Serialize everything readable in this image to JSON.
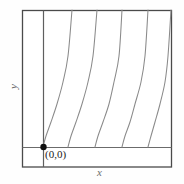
{
  "figure": {
    "background_color": "#fefefe",
    "frame_color": "#4a4a4a",
    "axis_color": "#6b6b6b",
    "curve_color": "#8a8a8a",
    "point_color": "#111111",
    "origin_label": "(0,0)",
    "x_axis_label": "x",
    "y_axis_label": "y"
  },
  "chart_data": {
    "type": "line",
    "title": "",
    "xlabel": "x",
    "ylabel": "y",
    "grid": false,
    "legend": null,
    "annotations": [
      {
        "text": "(0,0)",
        "x": 0,
        "y": 0,
        "marker": "filled-dot"
      }
    ],
    "frame": {
      "left": 22,
      "top": 10,
      "right": 172,
      "bottom": 167
    },
    "axes": {
      "x_axis_y_px": 147,
      "y_axis_x_px": 43
    },
    "xlim": [
      0,
      5.2
    ],
    "ylim": [
      0,
      4.8
    ],
    "series": [
      {
        "name": "curve-1",
        "points_px": [
          [
            43,
            147
          ],
          [
            46,
            136
          ],
          [
            51,
            122
          ],
          [
            57,
            104
          ],
          [
            63,
            82
          ],
          [
            68,
            56
          ],
          [
            72,
            10
          ]
        ]
      },
      {
        "name": "curve-2",
        "points_px": [
          [
            68,
            147
          ],
          [
            71,
            136
          ],
          [
            76,
            122
          ],
          [
            82,
            104
          ],
          [
            88,
            82
          ],
          [
            93,
            56
          ],
          [
            97,
            10
          ]
        ]
      },
      {
        "name": "curve-3",
        "points_px": [
          [
            95,
            147
          ],
          [
            98,
            136
          ],
          [
            103,
            122
          ],
          [
            109,
            104
          ],
          [
            114,
            82
          ],
          [
            119,
            56
          ],
          [
            122,
            10
          ]
        ]
      },
      {
        "name": "curve-4",
        "points_px": [
          [
            122,
            147
          ],
          [
            125,
            136
          ],
          [
            130,
            122
          ],
          [
            135,
            104
          ],
          [
            141,
            82
          ],
          [
            145,
            56
          ],
          [
            148,
            10
          ]
        ]
      },
      {
        "name": "curve-5",
        "points_px": [
          [
            148,
            147
          ],
          [
            151,
            136
          ],
          [
            155,
            122
          ],
          [
            160,
            104
          ],
          [
            165,
            82
          ],
          [
            168,
            56
          ],
          [
            171,
            10
          ]
        ]
      }
    ]
  }
}
